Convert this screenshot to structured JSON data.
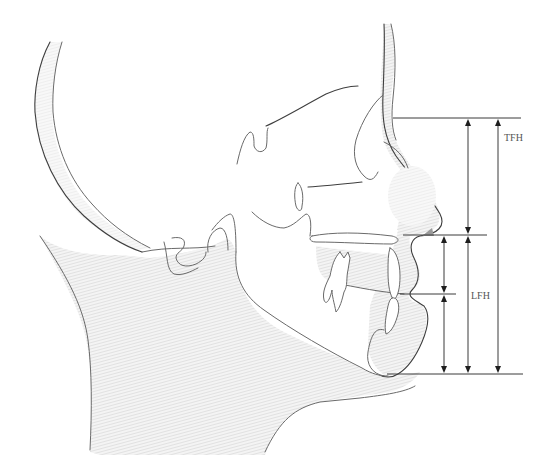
{
  "figure": {
    "type": "cephalometric-profile-diagram"
  },
  "labels": {
    "tfh": "TFH",
    "lfh": "LFH"
  },
  "measurements": [
    {
      "id": "tfh",
      "name": "TFH",
      "from_line": "nasion",
      "to_line": "menton",
      "x": 498,
      "y_top": 118,
      "y_bottom": 374
    },
    {
      "id": "upper-face",
      "name": "",
      "from_line": "nasion",
      "to_line": "subnasale",
      "x": 468,
      "y_top": 118,
      "y_bottom": 235
    },
    {
      "id": "lfh",
      "name": "LFH",
      "from_line": "subnasale",
      "to_line": "menton",
      "x": 468,
      "y_top": 235,
      "y_bottom": 374
    },
    {
      "id": "upper-lip",
      "name": "",
      "from_line": "subnasale",
      "to_line": "stomion",
      "x": 444,
      "y_top": 235,
      "y_bottom": 294
    },
    {
      "id": "lower-lip-chin",
      "name": "",
      "from_line": "stomion",
      "to_line": "menton",
      "x": 444,
      "y_top": 294,
      "y_bottom": 374
    }
  ],
  "reference_lines": [
    {
      "id": "nasion",
      "y": 118,
      "x1": 393,
      "x2": 521
    },
    {
      "id": "subnasale",
      "y": 235,
      "x1": 403,
      "x2": 487
    },
    {
      "id": "stomion",
      "y": 294,
      "x1": 400,
      "x2": 456
    },
    {
      "id": "menton",
      "y": 374,
      "x1": 387,
      "x2": 523
    }
  ],
  "colors": {
    "outline": "#6a6a6a",
    "measure_line": "#3a3a3a",
    "arrow": "#1e1e1e",
    "soft_tissue_hatch": "#c8c8c8",
    "label": "#555555"
  }
}
